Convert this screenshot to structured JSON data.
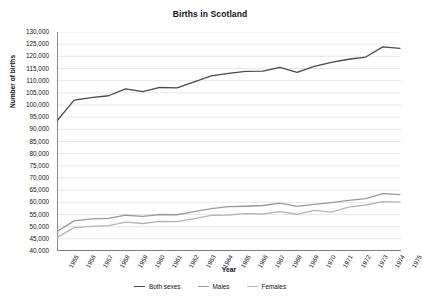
{
  "chart_data": {
    "type": "line",
    "title": "Births in Scotland",
    "xlabel": "Year",
    "ylabel": "Number of births",
    "grid": true,
    "legend_position": "bottom",
    "ylim": [
      40000,
      130000
    ],
    "ytick_step": 5000,
    "ytick_labels": [
      "130,000",
      "125,000",
      "120,000",
      "115,000",
      "110,000",
      "105,000",
      "100,000",
      "95,000",
      "90,000",
      "85,000",
      "80,000",
      "75,000",
      "70,000",
      "65,000",
      "60,000",
      "55,000",
      "50,000",
      "45,000",
      "40,000"
    ],
    "ytick_values": [
      130000,
      125000,
      120000,
      115000,
      110000,
      105000,
      100000,
      95000,
      90000,
      85000,
      80000,
      75000,
      70000,
      65000,
      60000,
      55000,
      50000,
      45000,
      40000
    ],
    "categories": [
      "1955",
      "1956",
      "1957",
      "1958",
      "1959",
      "1960",
      "1961",
      "1962",
      "1963",
      "1964",
      "1965",
      "1966",
      "1967",
      "1968",
      "1969",
      "1970",
      "1971",
      "1972",
      "1973",
      "1974",
      "1975"
    ],
    "series": [
      {
        "name": "Both sexes",
        "color": "#4a4a4a",
        "values": [
          93500,
          102000,
          103000,
          103800,
          106600,
          105500,
          107200,
          107000,
          109500,
          112000,
          113000,
          113800,
          113900,
          115500,
          113400,
          115900,
          117500,
          118800,
          119700,
          123900,
          123300
        ]
      },
      {
        "name": "Males",
        "color": "#9a9a9a",
        "values": [
          48000,
          52400,
          53200,
          53400,
          54700,
          54200,
          55000,
          54900,
          56200,
          57400,
          58200,
          58400,
          58700,
          59700,
          58300,
          59200,
          59900,
          60800,
          61500,
          63600,
          63200
        ]
      },
      {
        "name": "Females",
        "color": "#b5b5b5",
        "values": [
          45500,
          49600,
          50100,
          50400,
          51900,
          51300,
          52200,
          52100,
          53300,
          54600,
          54800,
          55400,
          55200,
          56200,
          55100,
          56700,
          56000,
          58000,
          58900,
          60300,
          60100
        ]
      }
    ]
  }
}
